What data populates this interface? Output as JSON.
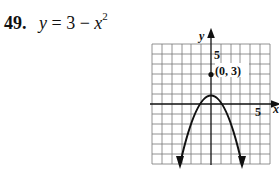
{
  "problem": {
    "number": "49.",
    "equation_lhs": "y",
    "equation_eq": "=",
    "equation_const": "3",
    "equation_minus": "−",
    "equation_var": "x",
    "equation_exp": "2"
  },
  "graph": {
    "x_axis_label": "x",
    "y_axis_label": "y",
    "x_tick_label": "5",
    "y_tick_label": "5",
    "vertex_label": "(0, 3)",
    "grid_range": {
      "xmin": -6,
      "xmax": 6,
      "ymin": -6,
      "ymax": 6
    },
    "vertex": [
      0,
      3
    ]
  }
}
